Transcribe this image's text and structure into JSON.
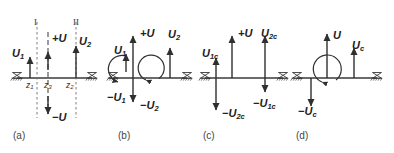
{
  "figure": {
    "width": 394,
    "height": 153,
    "background_color": "#ffffff",
    "line_color": "#3a3a3a",
    "text_color": "#222222"
  },
  "panels": [
    {
      "id": "a",
      "tag": "(a)",
      "section_markers": [
        "I",
        "II"
      ],
      "station_labels": [
        "z",
        "1",
        "z",
        "3",
        "z",
        "2"
      ],
      "stations": [
        {
          "label_base": "z",
          "label_sub": "1"
        },
        {
          "label_base": "z",
          "label_sub": "3"
        },
        {
          "label_base": "z",
          "label_sub": "2"
        }
      ],
      "vectors": [
        {
          "label_base": "U",
          "label_sub": "1",
          "sign": "",
          "direction": "up"
        },
        {
          "label_base": "U",
          "label_sub": "",
          "sign": "+",
          "direction": "up"
        },
        {
          "label_base": "U",
          "label_sub": "",
          "sign": "−",
          "direction": "down"
        },
        {
          "label_base": "U",
          "label_sub": "2",
          "sign": "",
          "direction": "up"
        }
      ]
    },
    {
      "id": "b",
      "tag": "(b)",
      "vectors": [
        {
          "label_base": "U",
          "label_sub": "1",
          "sign": "",
          "direction": "up"
        },
        {
          "label_base": "U",
          "label_sub": "1",
          "sign": "−",
          "direction": "down"
        },
        {
          "label_base": "U",
          "label_sub": "",
          "sign": "+",
          "direction": "up"
        },
        {
          "label_base": "U",
          "label_sub": "2",
          "sign": "−",
          "direction": "down"
        },
        {
          "label_base": "U",
          "label_sub": "2",
          "sign": "",
          "direction": "up"
        }
      ],
      "moments": [
        {
          "name": "small-moment-arc",
          "sense": "counterclockwise"
        },
        {
          "name": "large-moment-arc",
          "sense": "counterclockwise"
        }
      ]
    },
    {
      "id": "c",
      "tag": "(c)",
      "vectors": [
        {
          "label_base": "U",
          "label_sub": "1c",
          "sign": "",
          "direction": "up"
        },
        {
          "label_base": "U",
          "label_sub": "2c",
          "sign": "−",
          "direction": "down"
        },
        {
          "label_base": "U",
          "label_sub": "",
          "sign": "+",
          "direction": "up"
        },
        {
          "label_base": "U",
          "label_sub": "2c",
          "sign": "",
          "direction": "up"
        },
        {
          "label_base": "U",
          "label_sub": "1c",
          "sign": "−",
          "direction": "down"
        }
      ]
    },
    {
      "id": "d",
      "tag": "(d)",
      "vectors": [
        {
          "label_base": "U",
          "label_sub": "",
          "sign": "",
          "direction": "up"
        },
        {
          "label_base": "U",
          "label_sub": "c",
          "sign": "−",
          "direction": "down"
        },
        {
          "label_base": "U",
          "label_sub": "c",
          "sign": "",
          "direction": "up"
        }
      ],
      "moments": [
        {
          "name": "large-moment-arc",
          "sense": "counterclockwise"
        }
      ]
    }
  ],
  "labels": {
    "a": {
      "U1": "U",
      "U1_sub": "1",
      "plusU": "+U",
      "minusU": "−U",
      "U2": "U",
      "U2_sub": "2",
      "roman_I": "I",
      "roman_II": "II",
      "z1": "z",
      "z1_sub": "1",
      "z3": "z",
      "z3_sub": "3",
      "z2": "z",
      "z2_sub": "2",
      "tag": "(a)"
    },
    "b": {
      "U1": "U",
      "U1_sub": "1",
      "mU1": "−U",
      "mU1_sub": "1",
      "plusU": "+U",
      "mU2": "−U",
      "mU2_sub": "2",
      "U2": "U",
      "U2_sub": "2",
      "tag": "(b)"
    },
    "c": {
      "U1c": "U",
      "U1c_sub": "1c",
      "mU2c": "−U",
      "mU2c_sub": "2c",
      "plusU": "+U",
      "U2c": "U",
      "U2c_sub": "2c",
      "mU1c": "−U",
      "mU1c_sub": "1c",
      "tag": "(c)"
    },
    "d": {
      "U": "U",
      "mUc": "−U",
      "mUc_sub": "c",
      "Uc": "U",
      "Uc_sub": "c",
      "tag": "(d)"
    }
  }
}
